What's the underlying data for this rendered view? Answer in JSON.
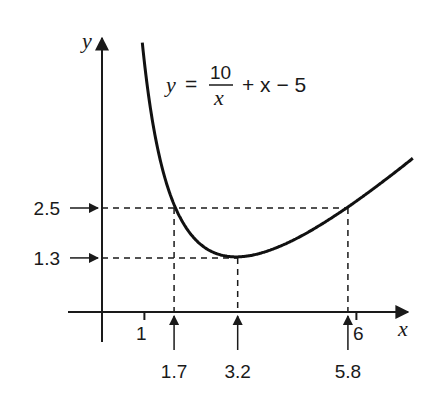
{
  "chart_data": {
    "type": "line",
    "title": "",
    "equation": {
      "lhs": "y",
      "equals": "=",
      "numerator": "10",
      "denominator": "x",
      "rest": "+ x − 5"
    },
    "function": "10/x + x - 5",
    "xlabel": "x",
    "ylabel": "y",
    "xlim": [
      -0.1,
      7.4
    ],
    "ylim": [
      -0.7,
      6.6
    ],
    "x_ticks": [
      {
        "value": 1,
        "label": "1"
      },
      {
        "value": 6,
        "label": "6"
      }
    ],
    "grid": false,
    "series": [
      {
        "name": "y = 10/x + x − 5",
        "x_range": [
          0.95,
          7.33
        ]
      }
    ],
    "guides": [
      {
        "y": 2.5,
        "y_label": "2.5",
        "x_points": [
          1.7,
          5.8
        ]
      },
      {
        "y": 1.3,
        "y_label": "1.3",
        "x_points": [
          3.2
        ]
      }
    ],
    "x_markers": [
      {
        "value": 1.7,
        "label": "1.7"
      },
      {
        "value": 3.2,
        "label": "3.2"
      },
      {
        "value": 5.8,
        "label": "5.8"
      }
    ],
    "y_markers": [
      {
        "value": 2.5,
        "label": "2.5"
      },
      {
        "value": 1.3,
        "label": "1.3"
      }
    ]
  }
}
